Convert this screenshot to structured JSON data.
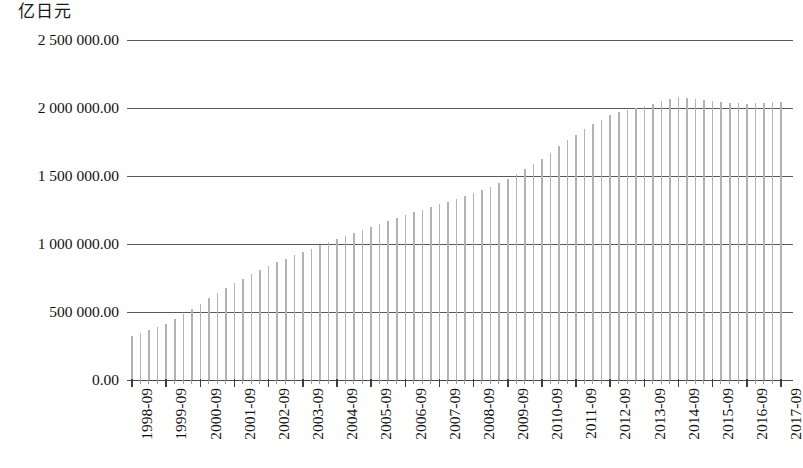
{
  "unit_caption": "亿日元",
  "chart_data": {
    "type": "bar",
    "title": "",
    "subtitle": "",
    "xlabel": "",
    "ylabel": "亿日元",
    "ylim": [
      0,
      2500000
    ],
    "grid": true,
    "legend": null,
    "y_ticks": [
      0,
      500000,
      1000000,
      1500000,
      2000000,
      2500000
    ],
    "y_tick_labels": [
      "0.00",
      "500 000.00",
      "1 000 000.00",
      "1 500 000.00",
      "2 000 000.00",
      "2 500 000.00"
    ],
    "x_tick_labels": [
      "1998-09",
      "1999-09",
      "2000-09",
      "2001-09",
      "2002-09",
      "2003-09",
      "2004-09",
      "2005-09",
      "2006-09",
      "2007-09",
      "2008-09",
      "2009-09",
      "2010-09",
      "2011-09",
      "2012-09",
      "2013-09",
      "2014-09",
      "2015-09",
      "2016-09",
      "2017-09"
    ],
    "x_tick_label_rotation": 90,
    "bar_color": "#b3b3b3",
    "gridline_color": "#595959",
    "series_frequency": "quarterly",
    "categories": [
      "1998-09",
      "1998-12",
      "1999-03",
      "1999-06",
      "1999-09",
      "1999-12",
      "2000-03",
      "2000-06",
      "2000-09",
      "2000-12",
      "2001-03",
      "2001-06",
      "2001-09",
      "2001-12",
      "2002-03",
      "2002-06",
      "2002-09",
      "2002-12",
      "2003-03",
      "2003-06",
      "2003-09",
      "2003-12",
      "2004-03",
      "2004-06",
      "2004-09",
      "2004-12",
      "2005-03",
      "2005-06",
      "2005-09",
      "2005-12",
      "2006-03",
      "2006-06",
      "2006-09",
      "2006-12",
      "2007-03",
      "2007-06",
      "2007-09",
      "2007-12",
      "2008-03",
      "2008-06",
      "2008-09",
      "2008-12",
      "2009-03",
      "2009-06",
      "2009-09",
      "2009-12",
      "2010-03",
      "2010-06",
      "2010-09",
      "2010-12",
      "2011-03",
      "2011-06",
      "2011-09",
      "2011-12",
      "2012-03",
      "2012-06",
      "2012-09",
      "2012-12",
      "2013-03",
      "2013-06",
      "2013-09",
      "2013-12",
      "2014-03",
      "2014-06",
      "2014-09",
      "2014-12",
      "2015-03",
      "2015-06",
      "2015-09",
      "2015-12",
      "2016-03",
      "2016-06",
      "2016-09",
      "2016-12",
      "2017-03",
      "2017-06",
      "2017-09"
    ],
    "values": [
      320000,
      345000,
      368000,
      392000,
      415000,
      447000,
      482000,
      520000,
      560000,
      600000,
      640000,
      678000,
      712000,
      745000,
      778000,
      808000,
      838000,
      866000,
      893000,
      918000,
      942000,
      966000,
      990000,
      1012000,
      1035000,
      1058000,
      1080000,
      1100000,
      1122000,
      1145000,
      1168000,
      1190000,
      1212000,
      1232000,
      1252000,
      1272000,
      1292000,
      1312000,
      1332000,
      1352000,
      1372000,
      1395000,
      1420000,
      1448000,
      1478000,
      1512000,
      1548000,
      1588000,
      1628000,
      1672000,
      1718000,
      1762000,
      1805000,
      1845000,
      1882000,
      1915000,
      1945000,
      1968000,
      1988000,
      2002000,
      2015000,
      2032000,
      2052000,
      2068000,
      2078000,
      2072000,
      2066000,
      2058000,
      2050000,
      2044000,
      2038000,
      2034000,
      2032000,
      2034000,
      2038000,
      2042000,
      2046000
    ]
  }
}
